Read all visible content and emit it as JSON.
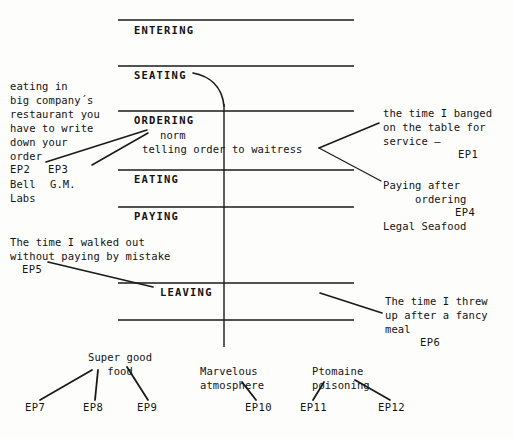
{
  "diagram": {
    "type": "script-hierarchy-diagram",
    "ink_color": "#131313",
    "background_color": "#fdfdfc"
  },
  "stages": [
    {
      "id": "entering",
      "label": "ENTERING"
    },
    {
      "id": "seating",
      "label": "SEATING"
    },
    {
      "id": "ordering",
      "label": "ORDERING"
    },
    {
      "id": "eating",
      "label": "EATING"
    },
    {
      "id": "paying",
      "label": "PAYING"
    },
    {
      "id": "leaving",
      "label": "LEAVING"
    }
  ],
  "ordering_detail": {
    "norm_label": "norm",
    "norm_text": "telling order to waitress"
  },
  "annotations": {
    "left_ordering": {
      "text": "eating in\nbig company´s\nrestaurant you\nhave to write\ndown your\norder",
      "ep_left": "EP2",
      "ep_right": "EP3",
      "source_left": "Bell",
      "source_right": "G.M.",
      "source_left_2": "Labs"
    },
    "ep1": {
      "text": "the time I banged\non the table for\nservice –",
      "ep": "EP1"
    },
    "ep4": {
      "text": "Paying after\n     ordering",
      "ep": "EP4",
      "source": "Legal Seafood"
    },
    "ep5": {
      "text": "The time I walked out\nwithout paying by mistake",
      "ep": "EP5"
    },
    "ep6": {
      "text": "The time I threw\nup after a fancy\nmeal",
      "ep": "EP6"
    }
  },
  "bottom_groups": [
    {
      "id": "super-good-food",
      "text": "Super good\n   food",
      "eps": [
        "EP7",
        "EP8",
        "EP9"
      ]
    },
    {
      "id": "marvelous-atmosphere",
      "text": "Marvelous\natmosphere",
      "eps": [
        "EP10"
      ]
    },
    {
      "id": "ptomaine-poisoning",
      "text": "Ptomaine\npoisoning",
      "eps": [
        "EP11",
        "EP12"
      ]
    }
  ]
}
